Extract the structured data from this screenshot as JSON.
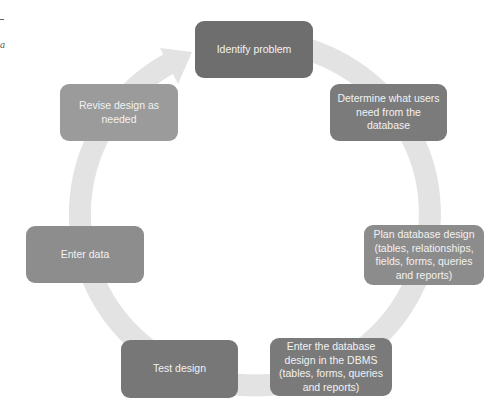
{
  "diagram": {
    "type": "cycle",
    "ring_color": "#e3e3e3",
    "steps": [
      {
        "label": "Identify problem",
        "color": "#6e6e6e"
      },
      {
        "label": "Determine what users need from the database",
        "color": "#7b7b7b"
      },
      {
        "label": "Plan database design (tables, relationships, fields, forms, queries and reports)",
        "color": "#8c8c8c"
      },
      {
        "label": "Enter the database design in the DBMS (tables, forms, queries and reports)",
        "color": "#7a7a7a"
      },
      {
        "label": "Test design",
        "color": "#777777"
      },
      {
        "label": "Enter data",
        "color": "#8d8d8d"
      },
      {
        "label": "Revise design as needed",
        "color": "#9b9b9b"
      }
    ]
  },
  "margin": {
    "letter": "a"
  }
}
